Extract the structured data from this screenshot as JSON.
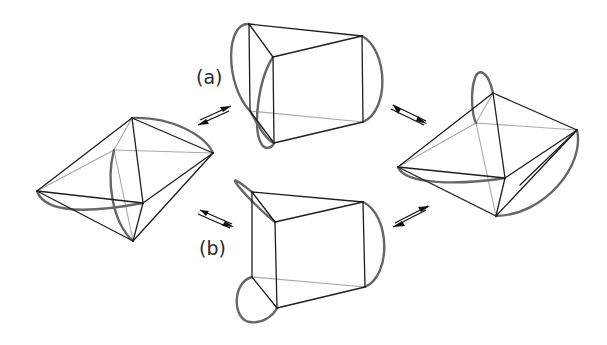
{
  "figure": {
    "type": "reaction-equilibrium-diagram",
    "colors": {
      "edge": "#1e1e1e",
      "hidden_edge": "#a8a8a8",
      "loop": "#666666",
      "background": "#ffffff"
    }
  },
  "labels": {
    "a": "(a)",
    "b": "(b)"
  },
  "structures": [
    {
      "id": "left",
      "name": "bicapped-tetrahedral-left",
      "position": "left"
    },
    {
      "id": "top",
      "name": "prism-pathway-a",
      "position": "top-center",
      "pathway": "(a)"
    },
    {
      "id": "bottom",
      "name": "prism-pathway-b",
      "position": "bottom-center",
      "pathway": "(b)"
    },
    {
      "id": "right",
      "name": "bicapped-tetrahedral-right",
      "position": "right"
    }
  ],
  "arrows": [
    {
      "id": "left-top",
      "from": "left",
      "to": "top",
      "kind": "equilibrium"
    },
    {
      "id": "left-bottom",
      "from": "left",
      "to": "bottom",
      "kind": "equilibrium"
    },
    {
      "id": "top-right",
      "from": "top",
      "to": "right",
      "kind": "equilibrium"
    },
    {
      "id": "bottom-right",
      "from": "bottom",
      "to": "right",
      "kind": "equilibrium"
    }
  ]
}
